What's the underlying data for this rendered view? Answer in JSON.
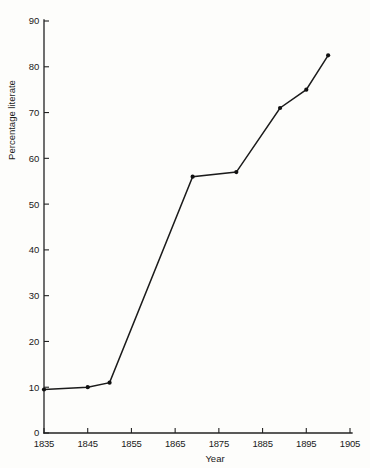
{
  "chart_data": {
    "type": "line",
    "title": "",
    "subtitle": "",
    "xlabel": "Year",
    "ylabel": "Percentage literate",
    "xlim": [
      1835,
      1905
    ],
    "ylim": [
      0,
      90
    ],
    "grid": false,
    "legend": null,
    "xticks": [
      1835,
      1845,
      1855,
      1865,
      1875,
      1885,
      1895,
      1905
    ],
    "xtick_labels": [
      "1835",
      "1845",
      "1855",
      "1865",
      "1875",
      "1885",
      "1895",
      "1905"
    ],
    "yticks": [
      0,
      10,
      20,
      30,
      40,
      50,
      60,
      70,
      80,
      90
    ],
    "ytick_labels": [
      "0",
      "10",
      "20",
      "30",
      "40",
      "50",
      "60",
      "70",
      "80",
      "90"
    ],
    "marker": "filled-circle",
    "line_color": "#1b1b1b",
    "marker_color": "#111111",
    "x": [
      1835,
      1845,
      1850,
      1869,
      1879,
      1889,
      1895,
      1900
    ],
    "values": [
      9.5,
      10.0,
      11.0,
      56.0,
      57.0,
      71.0,
      75.0,
      82.5
    ],
    "points": [
      {
        "x": 1835,
        "y": 9.5
      },
      {
        "x": 1845,
        "y": 10.0
      },
      {
        "x": 1850,
        "y": 11.0
      },
      {
        "x": 1869,
        "y": 56.0
      },
      {
        "x": 1879,
        "y": 57.0
      },
      {
        "x": 1889,
        "y": 71.0
      },
      {
        "x": 1895,
        "y": 75.0
      },
      {
        "x": 1900,
        "y": 82.5
      }
    ],
    "annotations": []
  },
  "labels": {
    "y_axis_title": "Percentage literate",
    "x_axis_title": "Year"
  }
}
